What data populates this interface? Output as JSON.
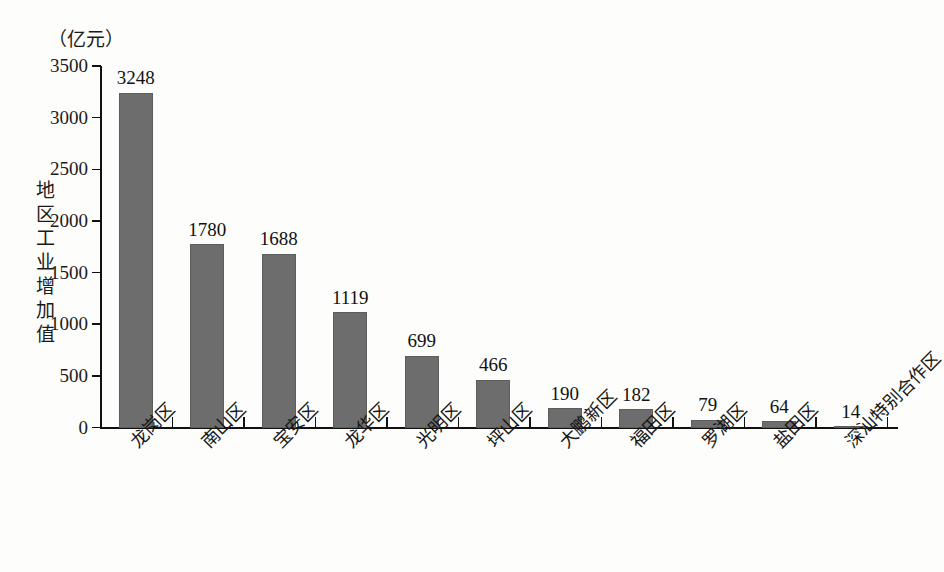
{
  "chart_data": {
    "type": "bar",
    "title": "",
    "subtitle": "",
    "unit_label": "（亿元）",
    "ylabel": "地区工业增加值",
    "xlabel": "",
    "ylim": [
      0,
      3500
    ],
    "ytick_step": 500,
    "yticks": [
      "0",
      "500",
      "1000",
      "1500",
      "2000",
      "2500",
      "3000",
      "3500"
    ],
    "ytick_values": [
      0,
      500,
      1000,
      1500,
      2000,
      2500,
      3000,
      3500
    ],
    "grid": false,
    "legend": null,
    "legend_position": "none",
    "bar_color": "#6d6d6d",
    "axis_color": "#111111",
    "background_color": "#fdfdfb",
    "categories": [
      "龙岗区",
      "南山区",
      "宝安区",
      "龙华区",
      "光明区",
      "坪山区",
      "大鹏新区",
      "福田区",
      "罗湖区",
      "盐田区",
      "深汕特别合作区"
    ],
    "values": [
      3248,
      1780,
      1688,
      1119,
      699,
      466,
      190,
      182,
      79,
      64,
      14
    ],
    "value_labels": [
      "3248",
      "1780",
      "1688",
      "1119",
      "699",
      "466",
      "190",
      "182",
      "79",
      "64",
      "14"
    ]
  }
}
